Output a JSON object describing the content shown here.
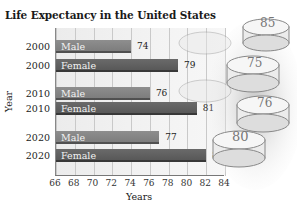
{
  "chart_data": {
    "type": "bar",
    "orientation": "horizontal",
    "title": "Life Expectancy in the United States",
    "xlabel": "Years",
    "ylabel": "Year",
    "xlim": [
      66,
      84
    ],
    "x_ticks": [
      "66",
      "68",
      "70",
      "72",
      "74",
      "76",
      "78",
      "80",
      "82",
      "84"
    ],
    "grid": true,
    "legend": "none (series labeled inside bars)",
    "categories": [
      "2000",
      "2010",
      "2020"
    ],
    "series": [
      {
        "name": "Male",
        "values": [
          74,
          76,
          77
        ],
        "color": "#818181"
      },
      {
        "name": "Female",
        "values": [
          79,
          81,
          82
        ],
        "color": "#5e5e5e"
      }
    ],
    "bars": [
      {
        "year": "2000",
        "label": "Male",
        "value": 74,
        "value_text": "74"
      },
      {
        "year": "2000",
        "label": "Female",
        "value": 79,
        "value_text": "79"
      },
      {
        "year": "2010",
        "label": "Male",
        "value": 76,
        "value_text": "76"
      },
      {
        "year": "2010",
        "label": "Female",
        "value": 81,
        "value_text": "81"
      },
      {
        "year": "2020",
        "label": "Male",
        "value": 77,
        "value_text": "77"
      },
      {
        "year": "2020",
        "label": "Female",
        "value": 82,
        "value_text": "82"
      }
    ],
    "decoration": "birthday cake illustrations with numbers on the right"
  }
}
